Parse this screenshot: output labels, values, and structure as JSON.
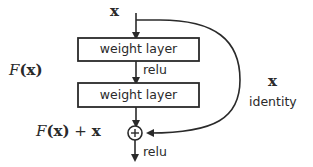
{
  "diagram": {
    "input_label": "x",
    "layers": [
      {
        "label": "weight layer"
      },
      {
        "label": "weight layer"
      }
    ],
    "inner_activation": "relu",
    "output_activation": "relu",
    "residual_function_label": {
      "script": "F",
      "arg": "(x)"
    },
    "sum_label": {
      "script": "F",
      "arg": "(x)",
      "plus": " + ",
      "x": "x"
    },
    "skip": {
      "x_label": "x",
      "name": "identity"
    },
    "add_symbol": "+",
    "colors": {
      "stroke": "#2a2a2a",
      "background": "#ffffff",
      "text": "#2a2a2a"
    }
  }
}
